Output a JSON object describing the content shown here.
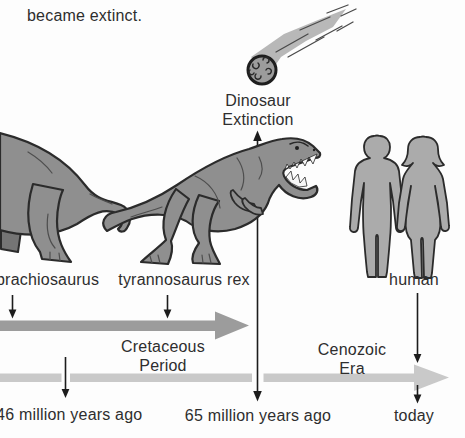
{
  "colors": {
    "background": "#fdfdfd",
    "text_color": "#2e2e2e",
    "era_arrow": "#9c9c9c",
    "timeline_arrow": "#c9c9c9",
    "figure_fill": "#8f8f8f",
    "figure_outline": "#2b2b2b",
    "arrow_line": "#1c1c1c"
  },
  "heading": {
    "text": "became extinct."
  },
  "extinction_callout": {
    "line1": "Dinosaur",
    "line2": "Extinction"
  },
  "species_labels": {
    "brachiosaurus": "brachiosaurus",
    "tyrannosaurus": "tyrannosaurus rex",
    "human": "human"
  },
  "era_labels": {
    "cretaceous_line1": "Cretaceous",
    "cretaceous_line2": "Period",
    "cenozoic_line1": "Cenozoic",
    "cenozoic_line2": "Era"
  },
  "time_markers": {
    "cretaceous_start": "146 million years ago",
    "extinction": "65 million years ago",
    "present": "today"
  },
  "illustrations": {
    "meteor": "falling meteor",
    "brachiosaurus": "brachiosaurus hindquarters (cut off at left edge)",
    "tyrannosaurus": "tyrannosaurus rex",
    "humans": "male and female human silhouettes"
  }
}
